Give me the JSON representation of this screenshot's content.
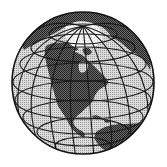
{
  "image": {
    "alt": "Black and white halftone globe centered on North America",
    "style": "monochrome halftone",
    "width": 167,
    "height": 167
  },
  "globe": {
    "center": [
      83,
      83
    ],
    "radius": 71,
    "focus_region": "North America",
    "colors": {
      "background": "#ffffff",
      "ocean_light": "#d8d8d8",
      "ocean_dot": "#9a9a9a",
      "land_dark": "#5a5a5a",
      "land_dot": "#2a2a2a",
      "ice": "#f2f2f2",
      "grid": "#1a1a1a",
      "outline": "#111111"
    },
    "features": [
      {
        "name": "Greenland ice cap",
        "shade": "white"
      },
      {
        "name": "North America",
        "shade": "dark"
      },
      {
        "name": "Eurasia (northern rim)",
        "shade": "dark"
      },
      {
        "name": "South America (partial)",
        "shade": "dark"
      },
      {
        "name": "Ocean",
        "shade": "light"
      }
    ],
    "graticule": {
      "meridians": 12,
      "parallels": 9
    }
  }
}
